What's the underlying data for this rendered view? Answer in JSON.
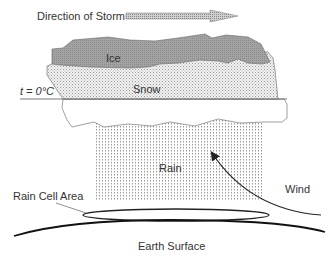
{
  "title": "Direction of Storm",
  "labels": {
    "direction": "Direction of Storm",
    "ice": "Ice",
    "snow": "Snow",
    "freezing_level": "t = 0°C",
    "rain": "Rain",
    "wind": "Wind",
    "rain_cell_area": "Rain Cell Area",
    "earth_surface": "Earth Surface"
  },
  "colors": {
    "ice_fill": "#9a9a9a",
    "snow_fill": "#e6e6e6",
    "rain_dots": "#9a9a9a",
    "outline": "#555555",
    "line": "#222222",
    "text": "#333333"
  }
}
